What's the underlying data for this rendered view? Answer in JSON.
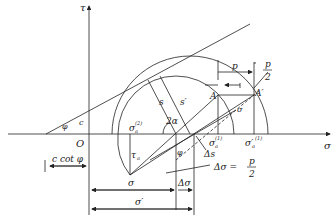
{
  "diagram": {
    "axes": {
      "x_label": "σ",
      "y_label": "τ",
      "origin_label": "O"
    },
    "envelope": {
      "angle_label": "φ",
      "intercept_label": "c"
    },
    "labels": {
      "c_cot_phi": "c cot φ",
      "sigma_a2": "σ",
      "sigma_a2_sub": "a",
      "sigma_a2_sup": "(2)",
      "sigma_a1": "σ",
      "sigma_a1_sub": "a",
      "sigma_a1_sup": "(1)",
      "sigma_a1_prime": "σ′",
      "sigma_a1_prime_sub": "a",
      "sigma_a1_prime_sup": "(1)",
      "s": "s",
      "s_prime": "s′",
      "two_alpha": "2α",
      "A": "A",
      "A_prime": "A′",
      "p": "p",
      "p_half_num": "p",
      "p_half_den": "2",
      "sigma_small": "σ",
      "tau_a": "τ",
      "tau_a_sub": "a",
      "phi_lower": "φ",
      "delta_s": "Δs",
      "delta_sigma_eq": "Δσ =",
      "delta_sigma_num": "p",
      "delta_sigma_den": "2",
      "dim_sigma": "σ",
      "dim_sigma_prime": "σ′",
      "dim_delta_sigma": "Δσ"
    }
  }
}
